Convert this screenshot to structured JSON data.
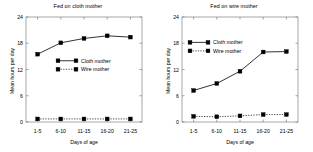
{
  "figure": {
    "background_color": "#ffffff",
    "line_color": "#000000",
    "axis_color": "#808080"
  },
  "chart_data": [
    {
      "type": "line",
      "title": "Fed on cloth mother",
      "xlabel": "Days of age",
      "ylabel": "Mean hours per day",
      "categories": [
        "1-5",
        "6-10",
        "11-15",
        "16-20",
        "21-25"
      ],
      "xtick_labels": [
        "1-5",
        "6-10",
        "11-15",
        "16-20",
        "21-25"
      ],
      "ytick_labels": [
        "0",
        "6",
        "12",
        "18",
        "24"
      ],
      "ytick_values": [
        0,
        6,
        12,
        18,
        24
      ],
      "ylim": [
        0,
        24
      ],
      "grid": false,
      "legend_position": "center-left",
      "series": [
        {
          "name": "Cloth mother",
          "style": "solid",
          "marker": "square",
          "values": [
            15.5,
            18.1,
            19.1,
            19.7,
            19.4
          ]
        },
        {
          "name": "Wire mother",
          "style": "dotted",
          "marker": "square",
          "values": [
            0.7,
            0.7,
            0.7,
            0.7,
            0.7
          ]
        }
      ]
    },
    {
      "type": "line",
      "title": "Fed on wire mother",
      "xlabel": "Days of age",
      "ylabel": "Mean hours per day",
      "categories": [
        "1-5",
        "6-10",
        "11-15",
        "16-20",
        "21-25"
      ],
      "xtick_labels": [
        "1-5",
        "6-10",
        "11-15",
        "16-20",
        "21-25"
      ],
      "ytick_labels": [
        "0",
        "6",
        "12",
        "18",
        "24"
      ],
      "ytick_values": [
        0,
        6,
        12,
        18,
        24
      ],
      "ylim": [
        0,
        24
      ],
      "grid": false,
      "legend_position": "upper-left",
      "series": [
        {
          "name": "Cloth mother",
          "style": "solid",
          "marker": "square",
          "values": [
            7.2,
            8.8,
            11.6,
            16.0,
            16.1
          ]
        },
        {
          "name": "Wire mother",
          "style": "dotted",
          "marker": "square",
          "values": [
            1.3,
            1.2,
            1.4,
            1.7,
            1.7
          ]
        }
      ]
    }
  ]
}
